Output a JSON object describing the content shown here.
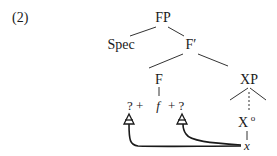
{
  "example_number": "(2)",
  "tree": {
    "root": "FP",
    "spec": "Spec",
    "fbar": "F′",
    "f_head": "F",
    "xp": "XP",
    "x_head": "X",
    "x_head_sup": "o",
    "x_terminal": "x",
    "f_terminal": "f",
    "left_slot": "? +",
    "right_slot": "+ ?"
  }
}
